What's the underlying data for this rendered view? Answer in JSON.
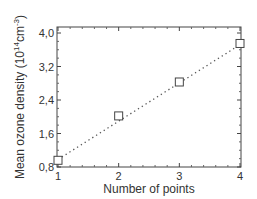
{
  "chart_data": {
    "type": "scatter",
    "title": "",
    "xlabel": "Number of points",
    "ylabel": "Mean ozone density (10^14 cm^-3)",
    "ylabel_parts": {
      "main": "Mean ozone density (10",
      "sup1": "14",
      "mid": "cm",
      "sup2": "-3",
      "end": ")"
    },
    "x": [
      1,
      2,
      3,
      4
    ],
    "y": [
      0.96,
      2.02,
      2.83,
      3.75
    ],
    "series": [
      {
        "name": "Mean ozone density",
        "marker": "open-square",
        "x": [
          1,
          2,
          3,
          4
        ],
        "y": [
          0.96,
          2.02,
          2.83,
          3.75
        ]
      },
      {
        "name": "Linear fit",
        "style": "dotted",
        "x": [
          1,
          4
        ],
        "y": [
          0.98,
          3.72
        ]
      }
    ],
    "xlim": [
      1,
      4
    ],
    "ylim": [
      0.8,
      4.0
    ],
    "xticks": [
      "1",
      "2",
      "3",
      "4"
    ],
    "yticks": [
      "0,8",
      "1,6",
      "2,4",
      "3,2",
      "4,0"
    ],
    "grid": false,
    "legend": null
  }
}
